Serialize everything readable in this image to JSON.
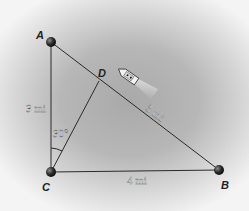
{
  "diagram": {
    "points": {
      "A": {
        "label": "A",
        "x": 51,
        "y": 42
      },
      "B": {
        "label": "B",
        "x": 219,
        "y": 170
      },
      "C": {
        "label": "C",
        "x": 51,
        "y": 172
      },
      "D": {
        "label": "D",
        "x": 98,
        "y": 82
      }
    },
    "segments": [
      {
        "from": "A",
        "to": "C",
        "label": "3 mi"
      },
      {
        "from": "C",
        "to": "B",
        "label": "4 mi"
      },
      {
        "from": "A",
        "to": "B",
        "label": "5 mi"
      },
      {
        "from": "C",
        "to": "D",
        "label": ""
      }
    ],
    "angle": {
      "vertex": "C",
      "label": "30°"
    },
    "objects": [
      {
        "type": "ship",
        "near": "D"
      }
    ],
    "colors": {
      "line": "#2a2a2a",
      "point": "#1e1e1e",
      "background": "#b3b3b3"
    }
  }
}
